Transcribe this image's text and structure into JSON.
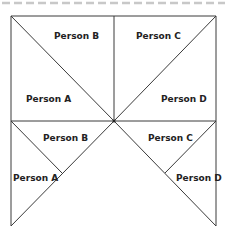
{
  "diagram": {
    "line_color": "#3a3a3a",
    "dash_color": "#c8c8c8",
    "top_panel": {
      "labels": [
        {
          "id": "a",
          "text": "Person A"
        },
        {
          "id": "b",
          "text": "Person B"
        },
        {
          "id": "c",
          "text": "Person C"
        },
        {
          "id": "d",
          "text": "Person D"
        }
      ]
    },
    "bottom_panel": {
      "labels": [
        {
          "id": "a",
          "text": "Person A"
        },
        {
          "id": "b",
          "text": "Person B"
        },
        {
          "id": "c",
          "text": "Person C"
        },
        {
          "id": "d",
          "text": "Person D"
        }
      ]
    }
  }
}
